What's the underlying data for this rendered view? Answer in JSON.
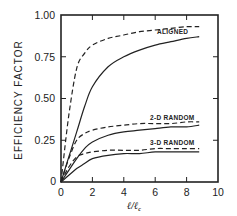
{
  "chart_data": {
    "type": "line",
    "title": "",
    "xlabel": "ℓ/ℓc",
    "ylabel": "EFFICIENCY FACTOR",
    "xlim": [
      0,
      10
    ],
    "ylim": [
      0,
      1.0
    ],
    "grid": false,
    "legend_position": "inline labels",
    "x_ticks": [
      "0",
      "2",
      "4",
      "6",
      "8",
      "10"
    ],
    "y_ticks": [
      "0",
      "0.25",
      "0.50",
      "0.75",
      "1.00"
    ],
    "x": [
      0,
      0.5,
      1,
      1.5,
      2,
      3,
      4,
      5,
      6,
      7,
      8,
      8.8
    ],
    "series": [
      {
        "name": "ALIGNED (dashed)",
        "style": "dashed",
        "group": "ALIGNED",
        "values": [
          0,
          0.4,
          0.68,
          0.77,
          0.82,
          0.86,
          0.88,
          0.9,
          0.91,
          0.92,
          0.93,
          0.93
        ]
      },
      {
        "name": "ALIGNED (solid)",
        "style": "solid",
        "group": "ALIGNED",
        "values": [
          0,
          0.15,
          0.3,
          0.45,
          0.57,
          0.69,
          0.75,
          0.79,
          0.82,
          0.84,
          0.86,
          0.87
        ]
      },
      {
        "name": "2-D RANDOM (dashed)",
        "style": "dashed",
        "group": "2-D RANDOM",
        "values": [
          0,
          0.14,
          0.25,
          0.29,
          0.31,
          0.33,
          0.34,
          0.35,
          0.35,
          0.35,
          0.36,
          0.36
        ]
      },
      {
        "name": "2-D RANDOM (solid)",
        "style": "solid",
        "group": "2-D RANDOM",
        "values": [
          0,
          0.07,
          0.14,
          0.2,
          0.24,
          0.28,
          0.3,
          0.31,
          0.32,
          0.33,
          0.33,
          0.34
        ]
      },
      {
        "name": "3-D RANDOM (dashed)",
        "style": "dashed",
        "group": "3-D RANDOM",
        "values": [
          0,
          0.09,
          0.15,
          0.17,
          0.18,
          0.19,
          0.19,
          0.19,
          0.2,
          0.2,
          0.2,
          0.2
        ]
      },
      {
        "name": "3-D RANDOM (solid)",
        "style": "solid",
        "group": "3-D RANDOM",
        "values": [
          0,
          0.04,
          0.08,
          0.11,
          0.14,
          0.16,
          0.17,
          0.17,
          0.18,
          0.18,
          0.18,
          0.18
        ]
      }
    ],
    "annotations": [
      {
        "text": "ALIGNED",
        "x": 6.5,
        "y": 0.9
      },
      {
        "text": "2-D RANDOM",
        "x": 6.5,
        "y": 0.38
      },
      {
        "text": "3-D RANDOM",
        "x": 6.5,
        "y": 0.23
      }
    ]
  },
  "labels": {
    "ylabel": "EFFICIENCY FACTOR",
    "xlabel_main": "ℓ/ℓ",
    "xlabel_sub": "c",
    "aligned": "ALIGNED",
    "random2d": "2-D RANDOM",
    "random3d": "3-D RANDOM",
    "x_ticks": [
      "0",
      "2",
      "4",
      "6",
      "8",
      "10"
    ],
    "y_ticks": [
      "0",
      "0.25",
      "0.50",
      "0.75",
      "1.00"
    ]
  },
  "colors": {
    "ink": "#222222",
    "background": "#ffffff"
  }
}
